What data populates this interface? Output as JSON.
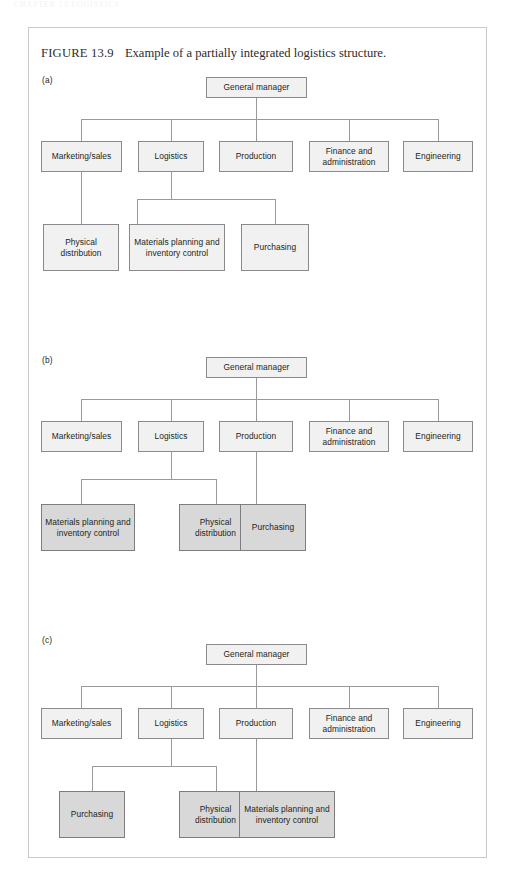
{
  "page_header": "CHAPTER 13  LOGISTICS",
  "figure": {
    "number": "FIGURE 13.9",
    "caption": "Example of a partially integrated logistics structure."
  },
  "panels": [
    {
      "label": "(a)",
      "root": "General manager",
      "level2": [
        "Marketing/sales",
        "Logistics",
        "Production",
        "Finance and administration",
        "Engineering"
      ],
      "level3": [
        {
          "label": "Physical distribution",
          "parent": "Marketing/sales",
          "shaded": false
        },
        {
          "label": "Materials planning and inventory control",
          "parent": "Logistics",
          "shaded": false
        },
        {
          "label": "Purchasing",
          "parent": "Logistics",
          "shaded": false
        }
      ]
    },
    {
      "label": "(b)",
      "root": "General manager",
      "level2": [
        "Marketing/sales",
        "Logistics",
        "Production",
        "Finance and administration",
        "Engineering"
      ],
      "level3": [
        {
          "label": "Materials planning and inventory control",
          "parent": "Logistics",
          "shaded": true
        },
        {
          "label": "Physical distribution",
          "parent": "Logistics",
          "shaded": true
        },
        {
          "label": "Purchasing",
          "parent": "Production",
          "shaded": true
        }
      ]
    },
    {
      "label": "(c)",
      "root": "General manager",
      "level2": [
        "Marketing/sales",
        "Logistics",
        "Production",
        "Finance and administration",
        "Engineering"
      ],
      "level3": [
        {
          "label": "Purchasing",
          "parent": "Logistics",
          "shaded": true
        },
        {
          "label": "Physical distribution",
          "parent": "Logistics",
          "shaded": true
        },
        {
          "label": "Materials planning and inventory control",
          "parent": "Production",
          "shaded": true
        }
      ]
    }
  ],
  "colors": {
    "node_fill": "#f1f1f1",
    "node_fill_shaded": "#d8d8d8",
    "node_border": "#8a8a8d",
    "connector": "#9a9a9d",
    "frame_border": "#c9c9cc",
    "text": "#231f20"
  }
}
